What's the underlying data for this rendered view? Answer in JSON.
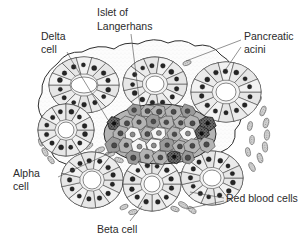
{
  "figure": {
    "background_color": "#ffffff",
    "ink_color": "#2e2e2e",
    "text_color": "#2b2b2b"
  },
  "labels": {
    "islet": {
      "line1": "Islet of",
      "line2": "Langerhans"
    },
    "delta": {
      "line1": "Delta",
      "line2": "cell"
    },
    "acini": {
      "line1": "Pancreatic",
      "line2": "acini"
    },
    "alpha": {
      "line1": "Alpha",
      "line2": "cell"
    },
    "rbc": {
      "line1": "Red blood cells"
    },
    "beta": {
      "line1": "Beta cell"
    }
  },
  "structures": {
    "acinus_fill": "#f2f2f2",
    "acinus_cell_fill": "#ededed",
    "lumen_fill": "#ffffff",
    "islet_cell_gray": "#b4b4b4",
    "islet_cell_gray_dark": "#9a9a9a",
    "islet_cell_light": "#f7f7f7",
    "delta_cell_fill": "#5d5d5d",
    "rbc_fill": "#cfcfcf",
    "stroma_fill": "#fbfbfb"
  },
  "acini": [
    {
      "name": "acinus-top-left",
      "cx": 84,
      "cy": 85,
      "rx": 35,
      "ry": 28,
      "cells": 14,
      "lumen_rx": 13,
      "lumen_ry": 8
    },
    {
      "name": "acinus-top-center",
      "cx": 155,
      "cy": 84,
      "rx": 32,
      "ry": 27,
      "cells": 13,
      "lumen_rx": 9,
      "lumen_ry": 8
    },
    {
      "name": "acinus-top-right",
      "cx": 226,
      "cy": 92,
      "rx": 35,
      "ry": 30,
      "cells": 14,
      "lumen_rx": 10,
      "lumen_ry": 9
    },
    {
      "name": "acinus-mid-left",
      "cx": 66,
      "cy": 130,
      "rx": 28,
      "ry": 26,
      "cells": 12,
      "lumen_rx": 8,
      "lumen_ry": 8
    },
    {
      "name": "acinus-bottom-left",
      "cx": 92,
      "cy": 180,
      "rx": 31,
      "ry": 28,
      "cells": 13,
      "lumen_rx": 9,
      "lumen_ry": 9
    },
    {
      "name": "acinus-bottom-center",
      "cx": 152,
      "cy": 184,
      "rx": 29,
      "ry": 27,
      "cells": 12,
      "lumen_rx": 8,
      "lumen_ry": 8
    },
    {
      "name": "acinus-bottom-right",
      "cx": 212,
      "cy": 178,
      "rx": 31,
      "ry": 27,
      "cells": 13,
      "lumen_rx": 9,
      "lumen_ry": 8
    }
  ],
  "islet": {
    "name": "islet-of-langerhans",
    "cx": 160,
    "cy": 134,
    "rx": 56,
    "ry": 30,
    "cell_count": 27,
    "delta_cell_count": 3
  },
  "counts": {
    "acini_drawn": 7,
    "labels_drawn": 6
  }
}
